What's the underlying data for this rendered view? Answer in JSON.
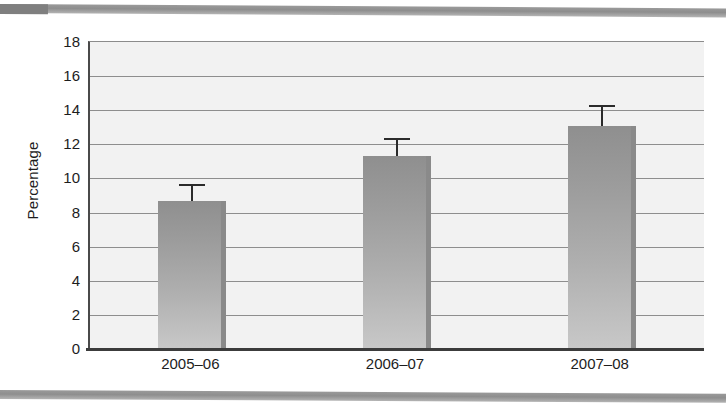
{
  "chart_data": {
    "type": "bar",
    "title": "",
    "xlabel": "",
    "ylabel": "Percentage",
    "categories": [
      "2005–06",
      "2006–07",
      "2007–08"
    ],
    "values": [
      8.7,
      11.3,
      13.1
    ],
    "error_upper": [
      9.7,
      12.4,
      14.3
    ],
    "error_lower": [
      8.7,
      11.3,
      13.1
    ],
    "ylim": [
      0,
      18
    ],
    "ytick_step": 2,
    "yticks": [
      18,
      16,
      14,
      12,
      10,
      8,
      6,
      4,
      2,
      0
    ],
    "ytick_labels": [
      "18",
      "16",
      "14",
      "12",
      "10",
      "8",
      "6",
      "4",
      "2",
      "0"
    ],
    "grid": "horizontal",
    "legend": "none",
    "series": [
      {
        "name": "Percentage",
        "values": [
          8.7,
          11.3,
          13.1
        ]
      }
    ],
    "colors": {
      "bar_top": "#8f8f8f",
      "bar_bottom": "#c8c8c8",
      "bar_edge": "#8a8a8a",
      "plot_background": "#f2f2f2",
      "gridline": "#8e8e8e",
      "axis": "#3c3c3c",
      "error_bar": "#2b2b2b",
      "text": "#1d1d1d",
      "banner": "#8e8e8e"
    }
  },
  "page": {
    "background": "#ffffff"
  }
}
